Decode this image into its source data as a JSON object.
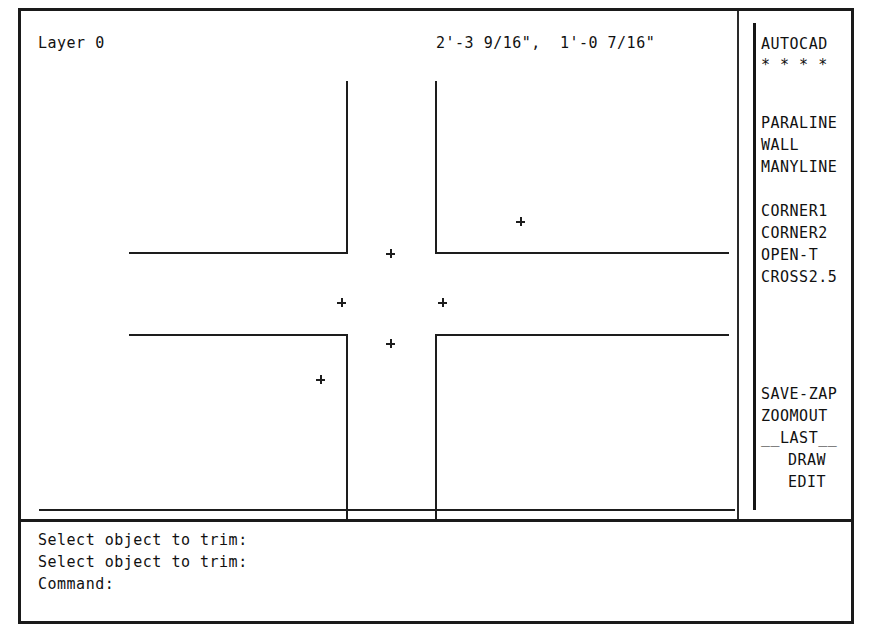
{
  "status_bar": {
    "layer": "Layer 0",
    "coordinates": "2'-3 9/16\",  1'-0 7/16\""
  },
  "screen_menu": {
    "title": "AUTOCAD",
    "separator": "* * * *",
    "groups": [
      {
        "items": [
          "PARALINE",
          "WALL",
          "MANYLINE"
        ]
      },
      {
        "items": [
          "CORNER1",
          "CORNER2",
          "OPEN-T",
          "CROSS2.5"
        ]
      },
      {
        "items": [
          "SAVE-ZAP",
          "ZOOMOUT",
          "__LAST__",
          "DRAW",
          "EDIT"
        ]
      }
    ]
  },
  "command_history": [
    "Select object to trim:",
    "Select object to trim:",
    "Command:"
  ],
  "drawing": {
    "line_color": "#1d1d1d",
    "walls_vertical": [
      {
        "x": 325,
        "y": 70,
        "length": 171
      },
      {
        "x": 325,
        "y": 323,
        "length": 185
      },
      {
        "x": 414,
        "y": 70,
        "length": 171
      },
      {
        "x": 414,
        "y": 323,
        "length": 185
      }
    ],
    "walls_horizontal": [
      {
        "x": 108,
        "y": 241,
        "length": 219
      },
      {
        "x": 414,
        "y": 241,
        "length": 294
      },
      {
        "x": 108,
        "y": 323,
        "length": 219
      },
      {
        "x": 414,
        "y": 323,
        "length": 294
      },
      {
        "x": 18,
        "y": 498,
        "length": 812
      }
    ],
    "blips": [
      {
        "x": 369,
        "y": 242
      },
      {
        "x": 499,
        "y": 210
      },
      {
        "x": 320,
        "y": 291
      },
      {
        "x": 421,
        "y": 291
      },
      {
        "x": 369,
        "y": 332
      },
      {
        "x": 299,
        "y": 368
      }
    ]
  },
  "colors": {
    "background": "#ffffff",
    "foreground": "#111111",
    "frame": "#1a1a1a"
  }
}
